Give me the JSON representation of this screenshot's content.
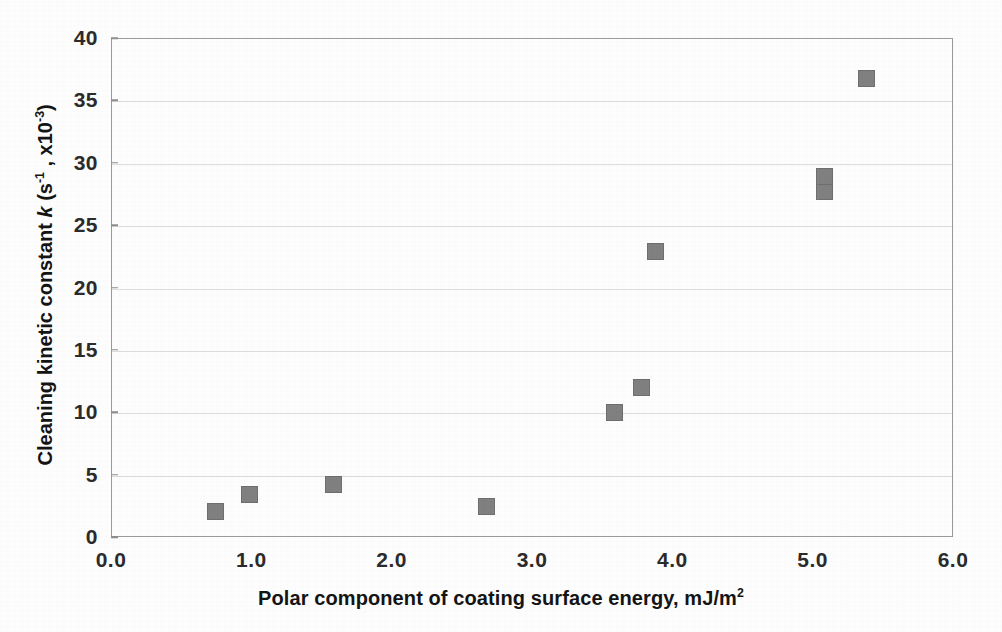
{
  "chart_data": {
    "type": "scatter",
    "title": "",
    "xlabel": "Polar component of coating surface energy, mJ/m²",
    "ylabel": "Cleaning kinetic constant k (s⁻¹ , x10⁻³)",
    "ylabel_parts": {
      "lead": "Cleaning kinetic constant ",
      "symbol": "k",
      "units_open": " (s",
      "units_sup1": "-1",
      "units_mid": " , x10",
      "units_sup2": "-3",
      "units_close": ")"
    },
    "xlabel_parts": {
      "text": "Polar component of coating surface energy, mJ/m",
      "sup": "2"
    },
    "xlim": [
      0.0,
      6.0
    ],
    "ylim": [
      0,
      40
    ],
    "xticks": [
      "0.0",
      "1.0",
      "2.0",
      "3.0",
      "4.0",
      "5.0",
      "6.0"
    ],
    "xtick_values": [
      0.0,
      1.0,
      2.0,
      3.0,
      4.0,
      5.0,
      6.0
    ],
    "yticks": [
      "0",
      "5",
      "10",
      "15",
      "20",
      "25",
      "30",
      "35",
      "40"
    ],
    "ytick_values": [
      0,
      5,
      10,
      15,
      20,
      25,
      30,
      35,
      40
    ],
    "grid": "horizontal-faint",
    "legend": "none",
    "marker": {
      "shape": "square",
      "fill_color": "#808080",
      "edge_color": "#6e6e6e",
      "size_px": 17
    },
    "frame_color": "#9a9a9a",
    "points": [
      {
        "x": 0.74,
        "y": 2.1
      },
      {
        "x": 0.98,
        "y": 3.5
      },
      {
        "x": 1.58,
        "y": 4.3
      },
      {
        "x": 2.67,
        "y": 2.5
      },
      {
        "x": 3.58,
        "y": 10.1
      },
      {
        "x": 3.77,
        "y": 12.1
      },
      {
        "x": 3.87,
        "y": 23.0
      },
      {
        "x": 5.08,
        "y": 27.8
      },
      {
        "x": 5.08,
        "y": 29.0
      },
      {
        "x": 5.38,
        "y": 36.8
      }
    ]
  }
}
